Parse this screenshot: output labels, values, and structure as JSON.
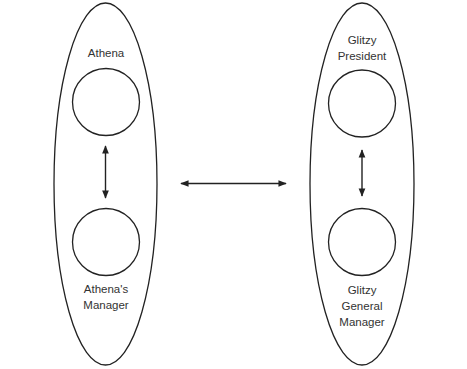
{
  "colors": {
    "stroke": "#222222",
    "text": "#333333",
    "background": "#ffffff"
  },
  "left_group": {
    "name": "Athena side",
    "top_label": "Athena",
    "bottom_label_line1": "Athena's",
    "bottom_label_line2": "Manager"
  },
  "right_group": {
    "name": "Glitzy side",
    "top_label_line1": "Glitzy",
    "top_label_line2": "President",
    "bottom_label_line1": "Glitzy",
    "bottom_label_line2": "General",
    "bottom_label_line3": "Manager"
  },
  "connectors": [
    {
      "from": "Athena",
      "to": "Athena's Manager",
      "type": "bidirectional-arrow"
    },
    {
      "from": "Glitzy President",
      "to": "Glitzy General Manager",
      "type": "bidirectional-arrow"
    },
    {
      "from": "Athena side",
      "to": "Glitzy side",
      "type": "bidirectional-arrow"
    }
  ]
}
